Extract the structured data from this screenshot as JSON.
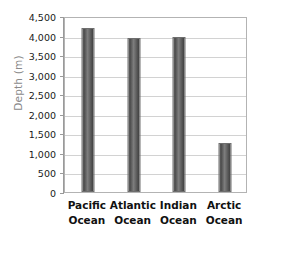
{
  "chart_data": {
    "type": "bar",
    "title": "",
    "xlabel": "",
    "ylabel": "Depth (m)",
    "categories": [
      "Pacific Ocean",
      "Atlantic Ocean",
      "Indian Ocean",
      "Arctic Ocean"
    ],
    "category_lines": [
      [
        "Pacific",
        "Ocean"
      ],
      [
        "Atlantic",
        "Ocean"
      ],
      [
        "Indian",
        "Ocean"
      ],
      [
        "Arctic",
        "Ocean"
      ]
    ],
    "values": [
      4200,
      3940,
      3960,
      1250
    ],
    "ylim": [
      0,
      4500
    ],
    "ytick_step": 500,
    "ytick_labels": [
      "4,500",
      "4,000",
      "3,500",
      "3,000",
      "2,500",
      "2,000",
      "1,500",
      "1,000",
      "500",
      "0"
    ],
    "ytick_values": [
      4500,
      4000,
      3500,
      3000,
      2500,
      2000,
      1500,
      1000,
      500,
      0
    ],
    "grid": true,
    "legend": false,
    "colors": {
      "bar_fill_dark": "#4a4a4a",
      "bar_fill_light": "#7d7d7d",
      "bar_border": "#6e6e6e",
      "gridline": "#d2d2d2",
      "plot_border": "#b3b3b3",
      "axis_line": "#9a9a9a",
      "axis_title_text": "#8a8a8a",
      "tick_text": "#1a1a1a",
      "category_text": "#111111",
      "background": "#ffffff"
    }
  }
}
